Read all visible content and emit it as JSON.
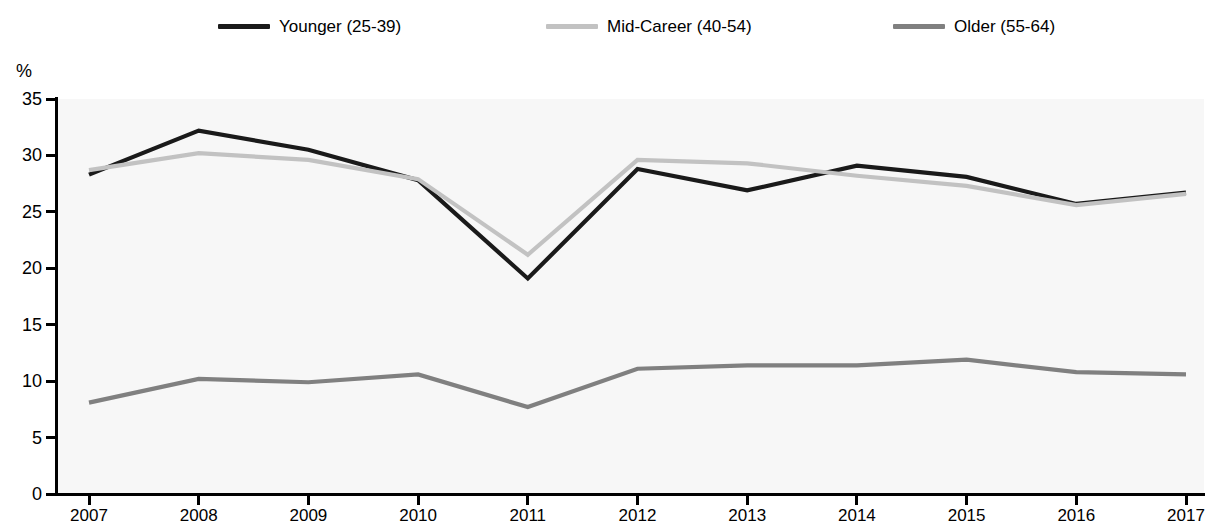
{
  "chart_data": {
    "type": "line",
    "title": "",
    "subtitle": "",
    "xlabel": "",
    "ylabel": "%",
    "y_unit_label": "%",
    "categories": [
      "2007",
      "2008",
      "2009",
      "2010",
      "2011",
      "2012",
      "2013",
      "2014",
      "2015",
      "2016",
      "2017"
    ],
    "x": [
      2007,
      2008,
      2009,
      2010,
      2011,
      2012,
      2013,
      2014,
      2015,
      2016,
      2017
    ],
    "xlim": [
      2007,
      2017
    ],
    "ylim": [
      0,
      35
    ],
    "y_ticks": [
      0,
      5,
      10,
      15,
      20,
      25,
      30,
      35
    ],
    "x_ticks": [
      "2007",
      "2008",
      "2009",
      "2010",
      "2011",
      "2012",
      "2013",
      "2014",
      "2015",
      "2016",
      "2017"
    ],
    "grid": false,
    "legend_position": "top",
    "series": [
      {
        "name": "Younger (25-39)",
        "color": "#1a1a1a",
        "values": [
          28.3,
          32.2,
          30.5,
          27.8,
          19.1,
          28.8,
          26.9,
          29.1,
          28.1,
          25.7,
          26.7
        ]
      },
      {
        "name": "Mid-Career (40-54)",
        "color": "#c2c2c2",
        "values": [
          28.7,
          30.2,
          29.6,
          27.9,
          21.2,
          29.6,
          29.3,
          28.2,
          27.3,
          25.6,
          26.6
        ]
      },
      {
        "name": "Older (55-64)",
        "color": "#808080",
        "values": [
          8.1,
          10.2,
          9.9,
          10.6,
          7.7,
          11.1,
          11.4,
          11.4,
          11.9,
          10.8,
          10.6
        ]
      }
    ]
  },
  "legend": {
    "items": [
      {
        "label": "Younger (25-39)",
        "color": "#1a1a1a"
      },
      {
        "label": "Mid-Career (40-54)",
        "color": "#c2c2c2"
      },
      {
        "label": "Older (55-64)",
        "color": "#808080"
      }
    ]
  },
  "axes": {
    "y_unit": "%",
    "y_tick_labels": [
      "35",
      "30",
      "25",
      "20",
      "15",
      "10",
      "5",
      "0"
    ],
    "x_tick_labels": [
      "2007",
      "2008",
      "2009",
      "2010",
      "2011",
      "2012",
      "2013",
      "2014",
      "2015",
      "2016",
      "2017"
    ]
  }
}
